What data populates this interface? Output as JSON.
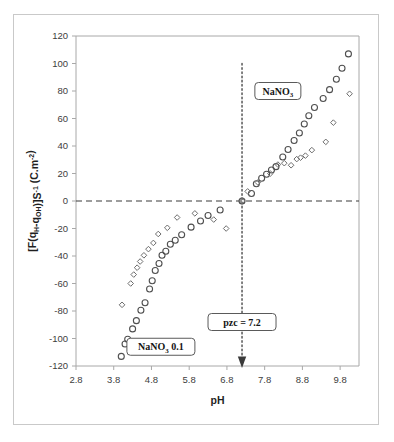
{
  "figure": {
    "background_color": "#ffffff",
    "frame_color": "#c9c9c9"
  },
  "chart_data": {
    "type": "scatter",
    "title": "",
    "xlabel": "pH",
    "ylabel": "[F(qH-qOH)]S-1 (C.m-2)",
    "ylabel_parts": {
      "prefix": "[F(q",
      "sub1": "H",
      "mid": "-q",
      "sub2": "OH",
      "after": ")]S",
      "sup1": "-1",
      "unit_open": " (C.m",
      "sup2": "-2",
      "unit_close": ")"
    },
    "xlim": [
      2.8,
      10.3
    ],
    "ylim": [
      -120,
      120
    ],
    "xticks": [
      2.8,
      3.8,
      4.8,
      5.8,
      6.8,
      7.8,
      8.8,
      9.8
    ],
    "xtick_labels": [
      "2.8",
      "3.8",
      "4.8",
      "5.8",
      "6.8",
      "7.8",
      "8.8",
      "9.8"
    ],
    "yticks": [
      -120,
      -100,
      -80,
      -60,
      -40,
      -20,
      0,
      20,
      40,
      60,
      80,
      100,
      120
    ],
    "ytick_labels": [
      "-120",
      "-100",
      "-80",
      "-60",
      "-40",
      "-20",
      "0",
      "20",
      "40",
      "60",
      "80",
      "100",
      "120"
    ],
    "grid": false,
    "legend_position": "inline-annotations",
    "zero_line_y": 0,
    "annotations": [
      {
        "name": "nano3-upper-label",
        "text": "NaNO",
        "subscript": "3",
        "suffix": "",
        "x": 8.15,
        "y": 80
      },
      {
        "name": "nano3-lower-label",
        "text": "NaNO",
        "subscript": "3",
        "suffix": " 0.1",
        "x": 5.05,
        "y": -106
      },
      {
        "name": "pzc-label",
        "text": "pzc = 7.2",
        "subscript": "",
        "suffix": "",
        "x": 7.2,
        "y": -88
      }
    ],
    "pzc": {
      "label": "pzc = 7.2",
      "value": 7.2,
      "line_top": 100,
      "line_bottom": -120,
      "arrow_at": -113
    },
    "series": [
      {
        "name": "NaNO3",
        "marker": "circle",
        "color": "#4f4f4f",
        "points": [
          [
            4.0,
            -113.0
          ],
          [
            4.1,
            -104.0
          ],
          [
            4.17,
            -100.5
          ],
          [
            4.3,
            -93.0
          ],
          [
            4.4,
            -87.0
          ],
          [
            4.52,
            -79.5
          ],
          [
            4.63,
            -74.0
          ],
          [
            4.75,
            -64.0
          ],
          [
            4.82,
            -58.0
          ],
          [
            4.9,
            -50.5
          ],
          [
            5.0,
            -45.5
          ],
          [
            5.08,
            -39.5
          ],
          [
            5.18,
            -36.5
          ],
          [
            5.3,
            -31.5
          ],
          [
            5.43,
            -28.5
          ],
          [
            5.6,
            -24.5
          ],
          [
            5.85,
            -19.0
          ],
          [
            6.1,
            -14.5
          ],
          [
            6.3,
            -10.5
          ],
          [
            6.62,
            -6.5
          ],
          [
            7.2,
            0.0
          ],
          [
            7.45,
            5.5
          ],
          [
            7.58,
            12.5
          ],
          [
            7.72,
            16.5
          ],
          [
            7.85,
            19.5
          ],
          [
            7.98,
            22.5
          ],
          [
            8.1,
            25.0
          ],
          [
            8.28,
            32.0
          ],
          [
            8.42,
            37.5
          ],
          [
            8.58,
            44.0
          ],
          [
            8.72,
            49.5
          ],
          [
            8.85,
            56.0
          ],
          [
            8.97,
            62.0
          ],
          [
            9.12,
            68.0
          ],
          [
            9.35,
            74.5
          ],
          [
            9.52,
            81.0
          ],
          [
            9.7,
            88.5
          ],
          [
            9.85,
            96.5
          ],
          [
            10.02,
            107.0
          ]
        ]
      },
      {
        "name": "NaNO3 0.1",
        "marker": "diamond",
        "color": "#6d6d6d",
        "points": [
          [
            4.02,
            -75.5
          ],
          [
            4.25,
            -60.0
          ],
          [
            4.33,
            -53.5
          ],
          [
            4.42,
            -48.5
          ],
          [
            4.5,
            -44.0
          ],
          [
            4.6,
            -39.5
          ],
          [
            4.72,
            -35.0
          ],
          [
            4.85,
            -30.5
          ],
          [
            4.98,
            -24.0
          ],
          [
            5.22,
            -19.5
          ],
          [
            5.48,
            -12.0
          ],
          [
            5.95,
            -9.0
          ],
          [
            6.45,
            -13.5
          ],
          [
            6.78,
            -20.0
          ],
          [
            7.2,
            0.0
          ],
          [
            7.35,
            7.0
          ],
          [
            7.62,
            13.5
          ],
          [
            7.95,
            20.0
          ],
          [
            8.15,
            26.5
          ],
          [
            8.32,
            27.5
          ],
          [
            8.5,
            26.0
          ],
          [
            8.65,
            30.5
          ],
          [
            8.75,
            31.5
          ],
          [
            8.88,
            33.0
          ],
          [
            9.05,
            37.0
          ],
          [
            9.42,
            43.0
          ],
          [
            9.62,
            57.0
          ],
          [
            10.05,
            78.0
          ]
        ]
      }
    ]
  }
}
